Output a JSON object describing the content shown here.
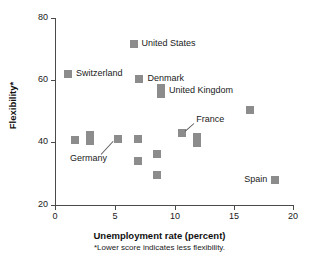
{
  "chart_data": {
    "type": "scatter",
    "title": "",
    "xlabel": "Unemployment rate (percent)",
    "ylabel": "Flexibility*",
    "footnote": "*Lower score indicates less flexibility.",
    "xlim": [
      0,
      20
    ],
    "ylim": [
      20,
      80
    ],
    "xticks": [
      "0",
      "5",
      "10",
      "15",
      "20"
    ],
    "yticks": [
      "20",
      "40",
      "60",
      "80"
    ],
    "grid": false,
    "legend": "none",
    "marker_color": "#8c8c8c",
    "points": [
      {
        "label": "Switzerland",
        "x": 1.1,
        "y": 62.0,
        "label_pos": "right"
      },
      {
        "label": "United States",
        "x": 6.6,
        "y": 71.5,
        "label_pos": "right"
      },
      {
        "label": "Denmark",
        "x": 7.1,
        "y": 60.5,
        "label_pos": "right"
      },
      {
        "label": "United Kingdom",
        "x": 8.9,
        "y": 56.5,
        "label_pos": "right"
      },
      {
        "label": "",
        "x": 1.7,
        "y": 41.0,
        "label_pos": "none"
      },
      {
        "label": "",
        "x": 2.9,
        "y": 41.5,
        "label_pos": "none"
      },
      {
        "label": "Germany",
        "x": 5.3,
        "y": 41.2,
        "label_pos": "leader-down-left"
      },
      {
        "label": "",
        "x": 7.0,
        "y": 41.2,
        "label_pos": "none"
      },
      {
        "label": "",
        "x": 7.0,
        "y": 34.0,
        "label_pos": "none"
      },
      {
        "label": "",
        "x": 8.6,
        "y": 36.5,
        "label_pos": "none"
      },
      {
        "label": "",
        "x": 8.6,
        "y": 29.5,
        "label_pos": "none"
      },
      {
        "label": "France",
        "x": 10.7,
        "y": 43.0,
        "label_pos": "leader-up-right"
      },
      {
        "label": "",
        "x": 11.9,
        "y": 40.8,
        "label_pos": "none"
      },
      {
        "label": "",
        "x": 16.4,
        "y": 50.5,
        "label_pos": "none"
      },
      {
        "label": "Spain",
        "x": 18.5,
        "y": 28.0,
        "label_pos": "left"
      }
    ]
  },
  "axis": {
    "y_title": "Flexibility*",
    "x_title": "Unemployment rate (percent)",
    "note": "*Lower score indicates less flexibility.",
    "y_tick_labels": [
      "80",
      "60",
      "40",
      "20"
    ],
    "x_tick_labels": [
      "0",
      "5",
      "10",
      "15",
      "20"
    ]
  },
  "labels": {
    "switzerland": "Switzerland",
    "united_states": "United States",
    "denmark": "Denmark",
    "united_kingdom": "United Kingdom",
    "germany": "Germany",
    "france": "France",
    "spain": "Spain"
  }
}
